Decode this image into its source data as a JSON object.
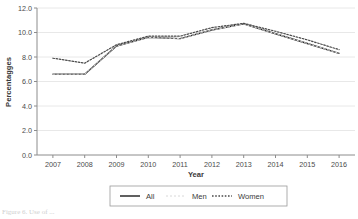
{
  "chart_data": {
    "type": "line",
    "title": "",
    "xlabel": "Year",
    "ylabel": "Percentagges",
    "categories": [
      "2007",
      "2008",
      "2009",
      "2010",
      "2011",
      "2012",
      "2013",
      "2014",
      "2015",
      "2016"
    ],
    "series": [
      {
        "name": "All",
        "style": "solid",
        "color": "#2b2b2b",
        "values": [
          6.6,
          6.6,
          8.9,
          9.6,
          9.5,
          10.2,
          10.7,
          9.9,
          9.1,
          8.3
        ]
      },
      {
        "name": "Men",
        "style": "faint",
        "color": "#d8d8d8",
        "values": [
          6.6,
          6.6,
          8.9,
          9.6,
          9.5,
          10.2,
          10.7,
          9.9,
          9.1,
          8.3
        ]
      },
      {
        "name": "Women",
        "style": "dotted",
        "color": "#4a4a4a",
        "values": [
          7.9,
          7.5,
          9.0,
          9.7,
          9.7,
          10.4,
          10.75,
          10.1,
          9.4,
          8.6
        ]
      }
    ],
    "ylim": [
      0.0,
      12.0
    ],
    "y_ticks": [
      "0.0",
      "2.0",
      "4.0",
      "6.0",
      "8.0",
      "10.0",
      "12.0"
    ],
    "y_tick_values": [
      0.0,
      2.0,
      4.0,
      6.0,
      8.0,
      10.0,
      12.0
    ],
    "grid": true,
    "grid_color": "#e2e2e2",
    "legend_position": "bottom",
    "axis_color": "#8c8c8c",
    "background": "#ffffff"
  },
  "legend": {
    "items": [
      {
        "label": "All"
      },
      {
        "label": "Men"
      },
      {
        "label": "Women"
      }
    ]
  },
  "caption": {
    "text": "Figure 6.  Use of ..."
  }
}
